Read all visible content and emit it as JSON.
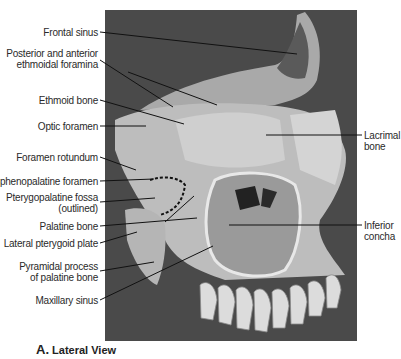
{
  "figure": {
    "caption_letter": "A.",
    "caption_text": "Lateral View",
    "background_photo_color": "#4a4a4a"
  },
  "labels_left": [
    {
      "id": "frontal-sinus",
      "lines": [
        "Frontal sinus"
      ]
    },
    {
      "id": "ethmoidal-foramina",
      "lines": [
        "Posterior and anterior",
        "ethmoidal foramina"
      ]
    },
    {
      "id": "ethmoid-bone",
      "lines": [
        "Ethmoid bone"
      ]
    },
    {
      "id": "optic-foramen",
      "lines": [
        "Optic foramen"
      ]
    },
    {
      "id": "foramen-rotundum",
      "lines": [
        "Foramen rotundum"
      ]
    },
    {
      "id": "sphenopalatine-foramen",
      "lines": [
        "Sphenopalatine foramen"
      ]
    },
    {
      "id": "pterygopalatine-fossa",
      "lines": [
        "Pterygopalatine fossa",
        "(outlined)"
      ]
    },
    {
      "id": "palatine-bone",
      "lines": [
        "Palatine bone"
      ]
    },
    {
      "id": "lateral-pterygoid-plate",
      "lines": [
        "Lateral pterygoid plate"
      ]
    },
    {
      "id": "pyramidal-process",
      "lines": [
        "Pyramidal process",
        "of palatine bone"
      ]
    },
    {
      "id": "maxillary-sinus",
      "lines": [
        "Maxillary sinus"
      ]
    }
  ],
  "labels_right": [
    {
      "id": "lacrimal-bone",
      "lines": [
        "Lacrimal",
        "bone"
      ]
    },
    {
      "id": "inferior-concha",
      "lines": [
        "Inferior",
        "concha"
      ]
    }
  ]
}
